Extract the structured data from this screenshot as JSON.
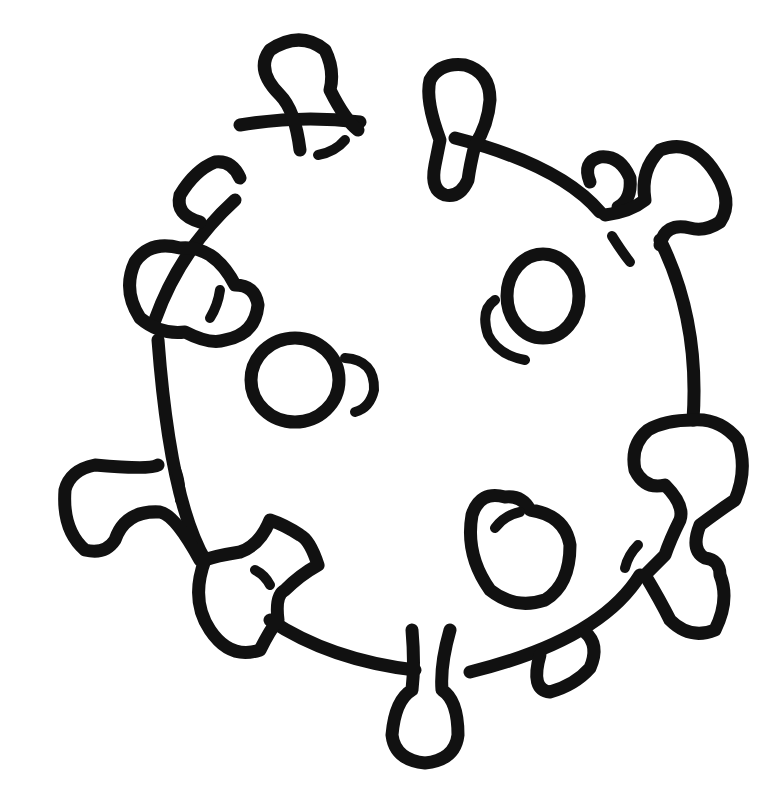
{
  "illustration": {
    "subject": "virus",
    "style": "black line art on white",
    "stroke_color": "#111111",
    "background_color": "#ffffff",
    "spike_count": 11,
    "surface_receptor_count": 4
  }
}
